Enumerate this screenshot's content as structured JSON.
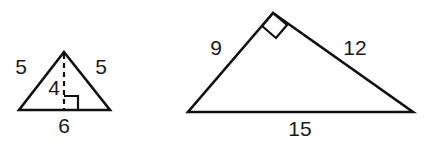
{
  "figure": {
    "background_color": "#ffffff",
    "stroke_color": "#111111",
    "label_color": "#1a1a1a"
  },
  "shapes": [
    {
      "id": "isosceles-triangle",
      "name": "Isosceles triangle with altitude",
      "vertices": {
        "apex": [
          64,
          52
        ],
        "bottom_left": [
          19,
          110
        ],
        "bottom_right": [
          110,
          110
        ]
      },
      "altitude": {
        "from": [
          64,
          52
        ],
        "to": [
          64,
          110
        ],
        "style": "dashed"
      },
      "right_angle_marker": {
        "at": [
          64,
          110
        ],
        "size": 14,
        "side": "right"
      },
      "labels": {
        "left_side": "5",
        "right_side": "5",
        "altitude": "4",
        "base": "6"
      },
      "label_positions": {
        "left_side": [
          21,
          68
        ],
        "right_side": [
          101,
          68
        ],
        "altitude": [
          54,
          89
        ],
        "base": [
          64,
          127
        ]
      }
    },
    {
      "id": "right-triangle",
      "name": "Right triangle with hypotenuse",
      "vertices": {
        "apex": [
          273,
          13
        ],
        "bottom_left": [
          188,
          112
        ],
        "bottom_right": [
          413,
          112
        ]
      },
      "right_angle_marker": {
        "at": [
          273,
          13
        ],
        "size": 17
      },
      "labels": {
        "left_side": "9",
        "right_side": "12",
        "base": "15"
      },
      "label_positions": {
        "left_side": [
          216,
          49
        ],
        "right_side": [
          355,
          49
        ],
        "base": [
          300,
          130
        ]
      }
    }
  ]
}
